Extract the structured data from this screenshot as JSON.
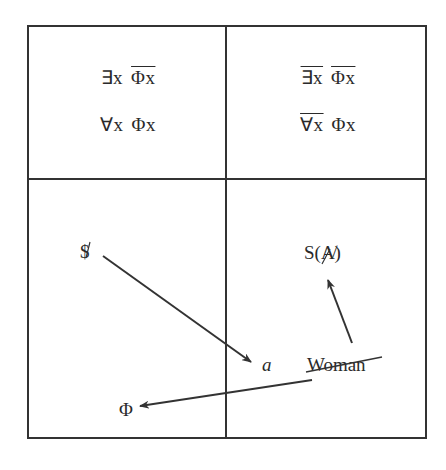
{
  "diagram": {
    "type": "quadrant-formula-diagram",
    "quadrants": {
      "top_left": {
        "row1": {
          "quantifier": "∃x",
          "predicate": "Φx",
          "quantifier_negated": false,
          "predicate_negated": true
        },
        "row2": {
          "quantifier": "∀x",
          "predicate": "Φx",
          "quantifier_negated": false,
          "predicate_negated": false
        }
      },
      "top_right": {
        "row1": {
          "quantifier": "∃x",
          "predicate": "Φx",
          "quantifier_negated": true,
          "predicate_negated": true
        },
        "row2": {
          "quantifier": "∀x",
          "predicate": "Φx",
          "quantifier_negated": true,
          "predicate_negated": false
        }
      },
      "bottom_left": {
        "labels": {
          "barred_s": "$",
          "phi": "Φ"
        }
      },
      "bottom_right": {
        "labels": {
          "s_of_barred_a": "S(A̸)",
          "objet_a": "a",
          "woman": "Woman"
        }
      }
    },
    "arrows": [
      {
        "from": "barred_s",
        "to": "objet_a"
      },
      {
        "from": "woman",
        "to": "s_of_barred_a"
      },
      {
        "from": "woman",
        "to": "phi"
      }
    ],
    "colors": {
      "line": "#333333",
      "text": "#2a2a2a",
      "background": "#ffffff"
    }
  }
}
